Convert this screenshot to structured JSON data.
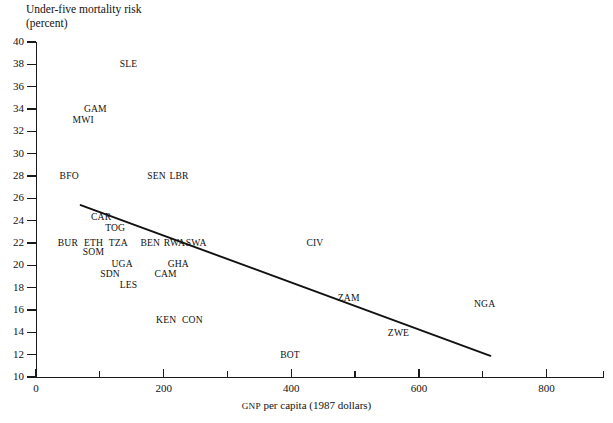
{
  "chart_data": {
    "type": "scatter",
    "title": "",
    "ylabel": "Under-five mortality risk",
    "ylabel_sub": "(percent)",
    "xlabel_prefix": "GNP",
    "xlabel_rest": " per capita (1987 dollars)",
    "xlabel": "GNP per capita (1987 dollars)",
    "xlim": [
      0,
      890
    ],
    "ylim": [
      10,
      40
    ],
    "xticks": [
      0,
      100,
      200,
      300,
      400,
      500,
      600,
      700,
      800
    ],
    "xticklabels": [
      {
        "value": 0,
        "label": "0"
      },
      {
        "value": 100,
        "label": ""
      },
      {
        "value": 200,
        "label": "200"
      },
      {
        "value": 300,
        "label": ""
      },
      {
        "value": 400,
        "label": "400"
      },
      {
        "value": 500,
        "label": ""
      },
      {
        "value": 600,
        "label": "600"
      },
      {
        "value": 700,
        "label": ""
      },
      {
        "value": 800,
        "label": "800"
      }
    ],
    "yticks": [
      10,
      12,
      14,
      16,
      18,
      20,
      22,
      24,
      26,
      28,
      30,
      32,
      34,
      36,
      38,
      40
    ],
    "yticklabels": [
      "10",
      "12",
      "14",
      "16",
      "18",
      "20",
      "22",
      "24",
      "26",
      "28",
      "30",
      "32",
      "34",
      "36",
      "38",
      "40"
    ],
    "grid": false,
    "legend": false,
    "marker_style": "text-label-only",
    "points": [
      {
        "label": "SLE",
        "x": 145,
        "y": 38.0
      },
      {
        "label": "GAM",
        "x": 93,
        "y": 34.0
      },
      {
        "label": "MWI",
        "x": 74,
        "y": 33.0
      },
      {
        "label": "BFO",
        "x": 52,
        "y": 28.0
      },
      {
        "label": "SEN",
        "x": 189,
        "y": 28.0
      },
      {
        "label": "LBR",
        "x": 224,
        "y": 28.0
      },
      {
        "label": "CAR",
        "x": 102,
        "y": 24.3
      },
      {
        "label": "TOG",
        "x": 124,
        "y": 23.3
      },
      {
        "label": "BUR",
        "x": 50,
        "y": 22.0
      },
      {
        "label": "ETH",
        "x": 90,
        "y": 22.0
      },
      {
        "label": "TZA",
        "x": 129,
        "y": 22.0
      },
      {
        "label": "BEN",
        "x": 179,
        "y": 22.0
      },
      {
        "label": "RWA",
        "x": 217,
        "y": 22.0
      },
      {
        "label": "SWA",
        "x": 251,
        "y": 22.0
      },
      {
        "label": "SOM",
        "x": 90,
        "y": 21.2
      },
      {
        "label": "UGA",
        "x": 135,
        "y": 20.1
      },
      {
        "label": "GHA",
        "x": 223,
        "y": 20.1
      },
      {
        "label": "SDN",
        "x": 116,
        "y": 19.2
      },
      {
        "label": "CAM",
        "x": 203,
        "y": 19.2
      },
      {
        "label": "LES",
        "x": 145,
        "y": 18.2
      },
      {
        "label": "KEN",
        "x": 204,
        "y": 15.1
      },
      {
        "label": "CON",
        "x": 245,
        "y": 15.1
      },
      {
        "label": "CIV",
        "x": 437,
        "y": 22.0
      },
      {
        "label": "ZAM",
        "x": 490,
        "y": 17.1
      },
      {
        "label": "ZWE",
        "x": 568,
        "y": 13.9
      },
      {
        "label": "BOT",
        "x": 398,
        "y": 12.0
      },
      {
        "label": "NGA",
        "x": 703,
        "y": 16.5
      }
    ],
    "trendline": {
      "label": "regression line",
      "x0": 70,
      "y0": 25.4,
      "x1": 712,
      "y1": 11.9
    }
  },
  "colors": {
    "ink": "#111111",
    "background": "#ffffff",
    "axis": "#1a1a1a",
    "trendline": "#111111"
  }
}
